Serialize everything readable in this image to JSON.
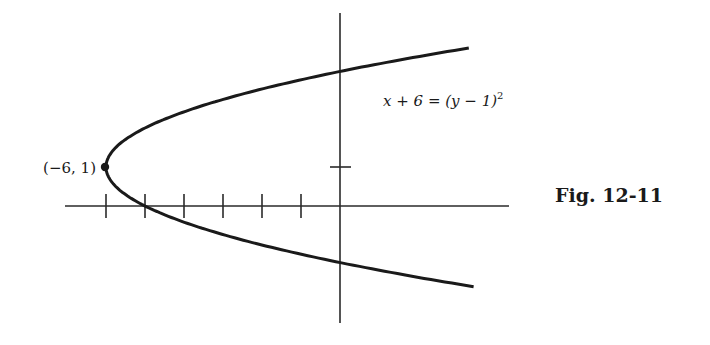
{
  "chart_data": {
    "type": "line",
    "title": "",
    "caption": "Fig. 12-11",
    "equation_label": "x + 6 = (y − 1)²",
    "equation": {
      "lhs": "x + 6",
      "rhs": "(y − 1)",
      "exponent": "2"
    },
    "curve": "x = (y - 1)^2 - 6",
    "vertex": {
      "x": -6,
      "y": 1,
      "label": "(−6, 1)"
    },
    "x_ticks": [
      -6,
      -5,
      -4,
      -3,
      -2,
      -1
    ],
    "y_ticks": [
      1
    ],
    "x_intercepts": [
      -5
    ],
    "y_intercepts": [
      3.45,
      -1.45
    ],
    "xlim": [
      -7,
      4.3
    ],
    "ylim": [
      -3.0,
      5.0
    ],
    "xlabel": "",
    "ylabel": "",
    "grid": false,
    "legend": null,
    "series": [
      {
        "name": "x + 6 = (y − 1)²",
        "points": [
          {
            "x": 3.3,
            "y": 4.05
          },
          {
            "x": 0,
            "y": 3.45
          },
          {
            "x": -2,
            "y": 3.0
          },
          {
            "x": -4,
            "y": 2.41
          },
          {
            "x": -5,
            "y": 2.0
          },
          {
            "x": -5.75,
            "y": 1.5
          },
          {
            "x": -6,
            "y": 1.0
          },
          {
            "x": -5.75,
            "y": 0.5
          },
          {
            "x": -5,
            "y": 0.0
          },
          {
            "x": -4,
            "y": -0.41
          },
          {
            "x": -2,
            "y": -1.0
          },
          {
            "x": 0,
            "y": -1.45
          },
          {
            "x": 3.4,
            "y": -2.07
          }
        ]
      }
    ]
  },
  "labels": {
    "vertex": "(−6, 1)",
    "equation_main": "x + 6 = (y − 1)",
    "equation_exp": "2",
    "caption": "Fig. 12-11"
  }
}
